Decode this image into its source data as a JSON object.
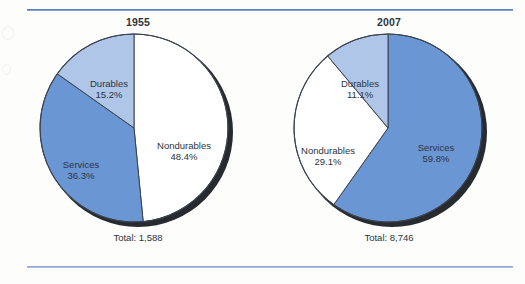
{
  "figure": {
    "background_color": "#fdfdfb",
    "rule_color_top": "#5d7fc4",
    "rule_color_bottom": "#93a9d6"
  },
  "colors": {
    "services": "#6b96d4",
    "durables": "#afc6e8",
    "nondurables": "#ffffff",
    "outline": "#3b4350",
    "shadow": "#15181c",
    "text": "#2b3440"
  },
  "chart_data": [
    {
      "type": "pie",
      "title": "1955",
      "categories": [
        "Nondurables",
        "Services",
        "Durables"
      ],
      "values": [
        48.4,
        36.3,
        15.2
      ],
      "value_labels": [
        "48.4%",
        "36.3%",
        "15.2%"
      ],
      "colors": [
        "#ffffff",
        "#6b96d4",
        "#afc6e8"
      ],
      "start_angle_deg": 0,
      "direction": "clockwise",
      "total_label": "Total: 1,588",
      "total_value": 1588,
      "legend": "none",
      "slices": [
        {
          "name": "Nondurables",
          "percent": 48.4,
          "percent_label": "48.4%",
          "color": "#ffffff"
        },
        {
          "name": "Services",
          "percent": 36.3,
          "percent_label": "36.3%",
          "color": "#6b96d4"
        },
        {
          "name": "Durables",
          "percent": 15.2,
          "percent_label": "15.2%",
          "color": "#afc6e8"
        }
      ]
    },
    {
      "type": "pie",
      "title": "2007",
      "categories": [
        "Services",
        "Nondurables",
        "Durables"
      ],
      "values": [
        59.8,
        29.1,
        11.1
      ],
      "value_labels": [
        "59.8%",
        "29.1%",
        "11.1%"
      ],
      "colors": [
        "#6b96d4",
        "#ffffff",
        "#afc6e8"
      ],
      "start_angle_deg": 0,
      "direction": "clockwise",
      "total_label": "Total: 8,746",
      "total_value": 8746,
      "legend": "none",
      "slices": [
        {
          "name": "Services",
          "percent": 59.8,
          "percent_label": "59.8%",
          "color": "#6b96d4"
        },
        {
          "name": "Nondurables",
          "percent": 29.1,
          "percent_label": "29.1%",
          "color": "#ffffff"
        },
        {
          "name": "Durables",
          "percent": 11.1,
          "percent_label": "11.1%",
          "color": "#afc6e8"
        }
      ]
    }
  ],
  "panels": {
    "left": {
      "title": "1955",
      "total_label": "Total: 1,588",
      "labels": [
        {
          "name": "Durables",
          "pct": "15.2%"
        },
        {
          "name": "Services",
          "pct": "36.3%"
        },
        {
          "name": "Nondurables",
          "pct": "48.4%"
        }
      ]
    },
    "right": {
      "title": "2007",
      "total_label": "Total: 8,746",
      "labels": [
        {
          "name": "Durables",
          "pct": "11.1%"
        },
        {
          "name": "Nondurables",
          "pct": "29.1%"
        },
        {
          "name": "Services",
          "pct": "59.8%"
        }
      ]
    }
  }
}
